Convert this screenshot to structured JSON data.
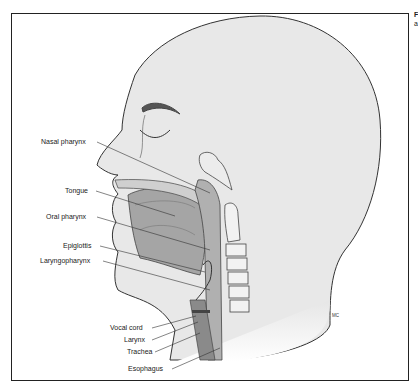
{
  "figure": {
    "caption_fragment": [
      "F",
      "a"
    ],
    "artist_signature": "MC"
  },
  "labels": [
    {
      "id": "nasal-pharynx",
      "text": "Nasal pharynx"
    },
    {
      "id": "tongue",
      "text": "Tongue"
    },
    {
      "id": "oral-pharynx",
      "text": "Oral pharynx"
    },
    {
      "id": "epiglottis",
      "text": "Epiglottis"
    },
    {
      "id": "laryngopharynx",
      "text": "Laryngopharynx"
    },
    {
      "id": "vocal-cord",
      "text": "Vocal cord"
    },
    {
      "id": "larynx",
      "text": "Larynx"
    },
    {
      "id": "trachea",
      "text": "Trachea"
    },
    {
      "id": "esophagus",
      "text": "Esophagus"
    }
  ],
  "colors": {
    "skin": "#e8e8e8",
    "tissue_dark": "#9a9a9a",
    "tissue_mid": "#b5b5b5",
    "outline": "#333333"
  }
}
